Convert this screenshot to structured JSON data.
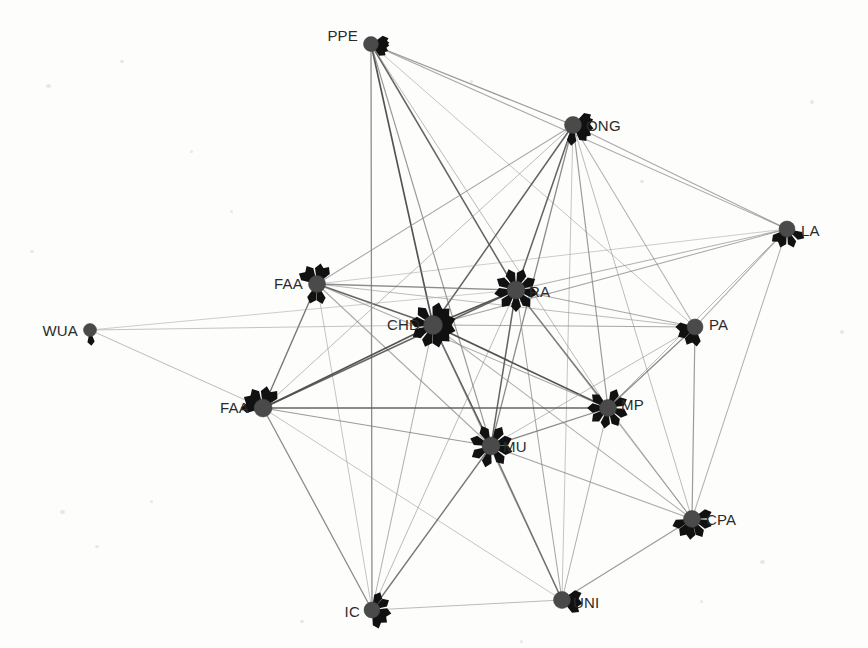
{
  "figure": {
    "type": "network-graph",
    "title": "",
    "background_color": "#fdfdfc",
    "node_color": "#4a4a4a",
    "spike_color": "#111111",
    "label_color": "#2b2b2b",
    "edge_color_dark": "#4d4d4d",
    "edge_color_light": "#bdbdbd",
    "width": 868,
    "height": 648
  },
  "chart_data": {
    "type": "network",
    "title": "",
    "xlabel": "",
    "ylabel": "",
    "node_count": 14,
    "edge_count": 57,
    "nodes": [
      {
        "id": "PPE",
        "label": "PPE",
        "x": 371,
        "y": 44,
        "r": 7.5,
        "label_dx": -13,
        "label_dy": -8,
        "label_anchor": "end",
        "spikes": [
          95,
          112,
          72,
          128,
          86
        ]
      },
      {
        "id": "ONG",
        "label": "ONG",
        "x": 573,
        "y": 125,
        "r": 8.5,
        "label_dx": 13,
        "label_dy": 1,
        "label_anchor": "start",
        "spikes": [
          185,
          100,
          75,
          120,
          60,
          140
        ]
      },
      {
        "id": "LA",
        "label": "LA",
        "x": 787,
        "y": 229,
        "r": 8,
        "label_dx": 14,
        "label_dy": 2,
        "label_anchor": "start",
        "spikes": [
          160,
          200,
          230,
          118
        ]
      },
      {
        "id": "FAA1",
        "label": "FAA",
        "x": 317,
        "y": 284,
        "r": 8.5,
        "label_dx": -14,
        "label_dy": 0,
        "label_anchor": "end",
        "spikes": [
          10,
          35,
          330,
          300,
          200,
          165
        ]
      },
      {
        "id": "RA",
        "label": "RA",
        "x": 516,
        "y": 290,
        "r": 9,
        "label_dx": 13,
        "label_dy": 2,
        "label_anchor": "start",
        "spikes": [
          20,
          60,
          100,
          140,
          180,
          220,
          260,
          300,
          340
        ]
      },
      {
        "id": "CHD",
        "label": "CHD",
        "x": 433,
        "y": 325,
        "r": 9.5,
        "label_dx": -13,
        "label_dy": 0,
        "label_anchor": "end",
        "spikes": [
          15,
          45,
          75,
          105,
          135,
          165,
          200,
          240,
          280,
          320
        ]
      },
      {
        "id": "WUA",
        "label": "WUA",
        "x": 90,
        "y": 330,
        "r": 6.5,
        "label_dx": -12,
        "label_dy": 1,
        "label_anchor": "end",
        "spikes": [
          175
        ]
      },
      {
        "id": "PA",
        "label": "PA",
        "x": 695,
        "y": 327,
        "r": 8,
        "label_dx": 14,
        "label_dy": -2,
        "label_anchor": "start",
        "spikes": [
          175,
          205,
          240,
          270
        ]
      },
      {
        "id": "FAA2",
        "label": "FAA",
        "x": 263,
        "y": 408,
        "r": 9,
        "label_dx": -14,
        "label_dy": 0,
        "label_anchor": "end",
        "spikes": [
          10,
          40,
          330,
          300,
          270
        ]
      },
      {
        "id": "MP",
        "label": "MP",
        "x": 608,
        "y": 408,
        "r": 8.5,
        "label_dx": 13,
        "label_dy": -3,
        "label_anchor": "start",
        "spikes": [
          25,
          65,
          110,
          150,
          190,
          230,
          270,
          310
        ]
      },
      {
        "id": "MU",
        "label": "MU",
        "x": 491,
        "y": 446,
        "r": 9,
        "label_dx": 12,
        "label_dy": 1,
        "label_anchor": "start",
        "spikes": [
          30,
          70,
          105,
          145,
          195,
          240,
          290,
          335
        ]
      },
      {
        "id": "CPA",
        "label": "CPA",
        "x": 692,
        "y": 519,
        "r": 8.5,
        "label_dx": 14,
        "label_dy": 1,
        "label_anchor": "start",
        "spikes": [
          70,
          110,
          150,
          185,
          215,
          250
        ]
      },
      {
        "id": "IC",
        "label": "IC",
        "x": 372,
        "y": 610,
        "r": 8,
        "label_dx": -12,
        "label_dy": 2,
        "label_anchor": "end",
        "spikes": [
          25,
          60,
          100,
          130,
          160
        ]
      },
      {
        "id": "UNI",
        "label": "UNI",
        "x": 562,
        "y": 600,
        "r": 8.5,
        "label_dx": 11,
        "label_dy": 3,
        "label_anchor": "start",
        "spikes": [
          70,
          100,
          125
        ]
      }
    ],
    "edges": [
      {
        "source": "PPE",
        "target": "ONG",
        "weight": 0.6
      },
      {
        "source": "PPE",
        "target": "LA",
        "weight": 0.5
      },
      {
        "source": "PPE",
        "target": "CHD",
        "weight": 1.0
      },
      {
        "source": "PPE",
        "target": "RA",
        "weight": 0.9
      },
      {
        "source": "PPE",
        "target": "MU",
        "weight": 0.6
      },
      {
        "source": "PPE",
        "target": "IC",
        "weight": 0.7
      },
      {
        "source": "PPE",
        "target": "MP",
        "weight": 0.4
      },
      {
        "source": "PPE",
        "target": "PA",
        "weight": 0.35
      },
      {
        "source": "ONG",
        "target": "LA",
        "weight": 0.5
      },
      {
        "source": "ONG",
        "target": "CHD",
        "weight": 0.9
      },
      {
        "source": "ONG",
        "target": "RA",
        "weight": 0.9
      },
      {
        "source": "ONG",
        "target": "MU",
        "weight": 0.7
      },
      {
        "source": "ONG",
        "target": "MP",
        "weight": 0.6
      },
      {
        "source": "ONG",
        "target": "FAA1",
        "weight": 0.5
      },
      {
        "source": "ONG",
        "target": "FAA2",
        "weight": 0.4
      },
      {
        "source": "ONG",
        "target": "CPA",
        "weight": 0.4
      },
      {
        "source": "ONG",
        "target": "UNI",
        "weight": 0.35
      },
      {
        "source": "ONG",
        "target": "PA",
        "weight": 0.45
      },
      {
        "source": "LA",
        "target": "CHD",
        "weight": 0.5
      },
      {
        "source": "LA",
        "target": "RA",
        "weight": 0.45
      },
      {
        "source": "LA",
        "target": "PA",
        "weight": 0.5
      },
      {
        "source": "LA",
        "target": "MP",
        "weight": 0.4
      },
      {
        "source": "LA",
        "target": "CPA",
        "weight": 0.45
      },
      {
        "source": "LA",
        "target": "FAA1",
        "weight": 0.3
      },
      {
        "source": "FAA1",
        "target": "CHD",
        "weight": 0.9
      },
      {
        "source": "FAA1",
        "target": "RA",
        "weight": 0.7
      },
      {
        "source": "FAA1",
        "target": "FAA2",
        "weight": 0.8
      },
      {
        "source": "FAA1",
        "target": "MU",
        "weight": 0.5
      },
      {
        "source": "FAA1",
        "target": "MP",
        "weight": 0.5
      },
      {
        "source": "FAA1",
        "target": "PA",
        "weight": 0.4
      },
      {
        "source": "FAA1",
        "target": "IC",
        "weight": 0.35
      },
      {
        "source": "RA",
        "target": "CHD",
        "weight": 1.0
      },
      {
        "source": "RA",
        "target": "MU",
        "weight": 0.9
      },
      {
        "source": "RA",
        "target": "MP",
        "weight": 0.8
      },
      {
        "source": "RA",
        "target": "FAA2",
        "weight": 0.9
      },
      {
        "source": "RA",
        "target": "PA",
        "weight": 0.5
      },
      {
        "source": "RA",
        "target": "CPA",
        "weight": 0.4
      },
      {
        "source": "RA",
        "target": "UNI",
        "weight": 0.5
      },
      {
        "source": "RA",
        "target": "IC",
        "weight": 0.4
      },
      {
        "source": "CHD",
        "target": "MU",
        "weight": 1.0
      },
      {
        "source": "CHD",
        "target": "MP",
        "weight": 1.0
      },
      {
        "source": "CHD",
        "target": "FAA2",
        "weight": 1.0
      },
      {
        "source": "CHD",
        "target": "PA",
        "weight": 0.5
      },
      {
        "source": "CHD",
        "target": "CPA",
        "weight": 0.45
      },
      {
        "source": "CHD",
        "target": "UNI",
        "weight": 0.5
      },
      {
        "source": "CHD",
        "target": "IC",
        "weight": 0.45
      },
      {
        "source": "CHD",
        "target": "WUA",
        "weight": 0.35
      },
      {
        "source": "WUA",
        "target": "FAA2",
        "weight": 0.4
      },
      {
        "source": "WUA",
        "target": "RA",
        "weight": 0.3
      },
      {
        "source": "PA",
        "target": "MP",
        "weight": 0.7
      },
      {
        "source": "PA",
        "target": "CPA",
        "weight": 0.6
      },
      {
        "source": "PA",
        "target": "MU",
        "weight": 0.4
      },
      {
        "source": "FAA2",
        "target": "MU",
        "weight": 0.6
      },
      {
        "source": "FAA2",
        "target": "MP",
        "weight": 0.9
      },
      {
        "source": "FAA2",
        "target": "IC",
        "weight": 0.7
      },
      {
        "source": "FAA2",
        "target": "UNI",
        "weight": 0.35
      },
      {
        "source": "MP",
        "target": "MU",
        "weight": 0.7
      },
      {
        "source": "MP",
        "target": "CPA",
        "weight": 0.5
      },
      {
        "source": "MP",
        "target": "UNI",
        "weight": 0.45
      },
      {
        "source": "MU",
        "target": "IC",
        "weight": 0.8
      },
      {
        "source": "MU",
        "target": "UNI",
        "weight": 0.8
      },
      {
        "source": "MU",
        "target": "CPA",
        "weight": 0.5
      },
      {
        "source": "CPA",
        "target": "UNI",
        "weight": 0.6
      },
      {
        "source": "IC",
        "target": "UNI",
        "weight": 0.4
      }
    ]
  },
  "background_specks": [
    {
      "x": 46,
      "y": 84,
      "w": 5,
      "h": 4
    },
    {
      "x": 120,
      "y": 60,
      "w": 4,
      "h": 3
    },
    {
      "x": 190,
      "y": 150,
      "w": 3,
      "h": 3
    },
    {
      "x": 60,
      "y": 510,
      "w": 5,
      "h": 4
    },
    {
      "x": 95,
      "y": 545,
      "w": 4,
      "h": 3
    },
    {
      "x": 150,
      "y": 500,
      "w": 3,
      "h": 3
    },
    {
      "x": 810,
      "y": 100,
      "w": 4,
      "h": 4
    },
    {
      "x": 760,
      "y": 560,
      "w": 5,
      "h": 4
    },
    {
      "x": 700,
      "y": 600,
      "w": 3,
      "h": 3
    },
    {
      "x": 300,
      "y": 620,
      "w": 4,
      "h": 3
    },
    {
      "x": 230,
      "y": 210,
      "w": 3,
      "h": 3
    },
    {
      "x": 640,
      "y": 180,
      "w": 4,
      "h": 3
    },
    {
      "x": 470,
      "y": 80,
      "w": 3,
      "h": 3
    },
    {
      "x": 840,
      "y": 330,
      "w": 4,
      "h": 4
    },
    {
      "x": 30,
      "y": 250,
      "w": 4,
      "h": 3
    },
    {
      "x": 520,
      "y": 640,
      "w": 3,
      "h": 3
    }
  ]
}
